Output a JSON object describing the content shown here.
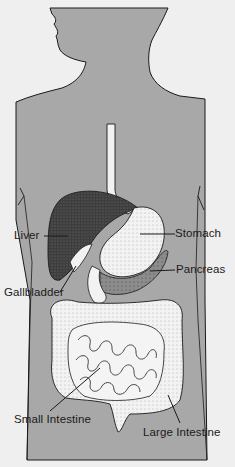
{
  "diagram": {
    "colors": {
      "background": "#efefef",
      "body_fill": "#a8a8a8",
      "outline": "#1a1a1a",
      "organ_light": "#f2f2f2",
      "liver": "#4a4a4a",
      "pancreas": "#8a8a8a"
    },
    "labels": [
      {
        "id": "liver",
        "text": "Liver"
      },
      {
        "id": "stomach",
        "text": "Stomach"
      },
      {
        "id": "pancreas",
        "text": "Pancreas"
      },
      {
        "id": "gallbladder",
        "text": "Gallbladder"
      },
      {
        "id": "small_intestine",
        "text": "Small Intestine"
      },
      {
        "id": "large_intestine",
        "text": "Large Intestine"
      }
    ]
  }
}
